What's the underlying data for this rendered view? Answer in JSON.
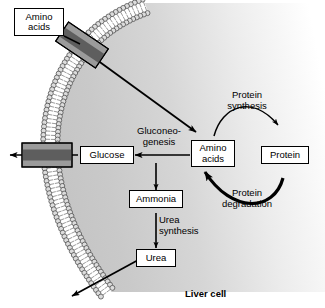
{
  "figure": {
    "caption": "Liver cell",
    "colors": {
      "cytoplasm_near": "#c9c9c9",
      "cytoplasm_far": "#ffffff",
      "membrane_head": "#d9d9d9",
      "membrane_outline": "#4a4a4a",
      "transporter_light": "#9b9b9b",
      "transporter_dark": "#5e5e5e",
      "stroke": "#000000",
      "background": "#ffffff"
    }
  },
  "boxes": {
    "amino_acids_outside": "Amino\nacids",
    "glucose": "Glucose",
    "amino_acids_inside": "Amino\nacids",
    "protein": "Protein",
    "ammonia": "Ammonia",
    "urea": "Urea"
  },
  "process_labels": {
    "gluconeogenesis": "Gluconeo-\ngenesis",
    "urea_synthesis": "Urea\nsynthesis",
    "protein_synthesis": "Protein\nsynthesis",
    "protein_degradation": "Protein\ndegradation"
  },
  "structures": {
    "membrane": "plasma-membrane-bilayer",
    "transporter_top": "amino-acid-transporter",
    "transporter_left": "glucose-transporter"
  },
  "arrows": [
    {
      "name": "amino-acid-uptake-arrow",
      "from": "amino_acids_outside",
      "to": "amino_acids_inside"
    },
    {
      "name": "gluconeogenesis-arrow",
      "from": "amino_acids_inside",
      "to": "glucose"
    },
    {
      "name": "glucose-export-arrow",
      "from": "glucose",
      "to": "outside"
    },
    {
      "name": "amino-acids-to-ammonia-arrow",
      "from": "amino_acids_inside",
      "to": "ammonia"
    },
    {
      "name": "urea-synthesis-arrow",
      "from": "ammonia",
      "to": "urea"
    },
    {
      "name": "urea-export-arrow",
      "from": "urea",
      "to": "outside"
    },
    {
      "name": "protein-synthesis-arrow",
      "from": "amino_acids_inside",
      "to": "protein"
    },
    {
      "name": "protein-degradation-arrow",
      "from": "protein",
      "to": "amino_acids_inside"
    }
  ]
}
